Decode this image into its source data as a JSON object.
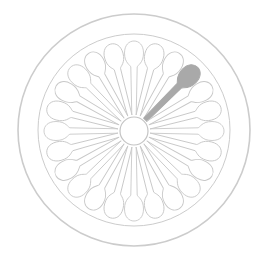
{
  "figure": {
    "slot_count": 24,
    "highlighted_slot_angle_deg": -45,
    "colors": {
      "background": "#ffffff",
      "outline": "#c8c8c8",
      "highlight": "#a9a9a9"
    }
  }
}
